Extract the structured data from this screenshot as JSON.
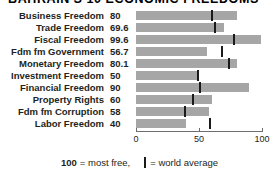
{
  "title": {
    "text": "BAHRAIN'S 10 ECONOMIC FREEDOMS",
    "clipped": true
  },
  "axis": {
    "ticks": [
      "0",
      "50",
      "100"
    ],
    "tick_values": [
      0,
      50,
      100
    ],
    "min": 0,
    "max": 100
  },
  "legend": {
    "scale_number": "100",
    "scale_text": "= most free,",
    "average_text": "= world average"
  },
  "colors": {
    "bar": "#a6a6a6",
    "tick": "#1a1a1a",
    "text": "#231f20",
    "axis": "#6d6e71",
    "background": "#ffffff"
  },
  "chart_data": {
    "type": "bar",
    "orientation": "horizontal",
    "title": "BAHRAIN'S 10 ECONOMIC FREEDOMS",
    "xlabel": "",
    "ylabel": "",
    "xlim": [
      0,
      100
    ],
    "xticks": [
      0,
      50,
      100
    ],
    "grid": false,
    "legend_position": "bottom",
    "categories": [
      "Business Freedom",
      "Trade Freedom",
      "Fiscal Freedom",
      "Fdm fm Government",
      "Monetary Freedom",
      "Investment Freedom",
      "Financial Freedom",
      "Property Rights",
      "Fdm fm Corruption",
      "Labor Freedom"
    ],
    "series": [
      {
        "name": "Country score",
        "values": [
          80,
          69.6,
          99.6,
          56.7,
          80.1,
          50,
          90,
          60,
          58,
          40
        ],
        "labels": [
          "80",
          "69.6",
          "99.6",
          "56.7",
          "80.1",
          "50",
          "90",
          "60",
          "58",
          "40"
        ]
      },
      {
        "name": "World average",
        "marker": "vertical-line",
        "values": [
          60,
          63,
          78,
          68,
          74,
          49,
          51,
          45,
          39,
          59
        ]
      }
    ]
  },
  "rows": [
    {
      "label": "Business Freedom",
      "value": "80",
      "score": 80,
      "world_average": 60
    },
    {
      "label": "Trade Freedom",
      "value": "69.6",
      "score": 69.6,
      "world_average": 63
    },
    {
      "label": "Fiscal Freedom",
      "value": "99.6",
      "score": 99.6,
      "world_average": 78
    },
    {
      "label": "Fdm fm Government",
      "value": "56.7",
      "score": 56.7,
      "world_average": 68
    },
    {
      "label": "Monetary Freedom",
      "value": "80.1",
      "score": 80.1,
      "world_average": 74
    },
    {
      "label": "Investment Freedom",
      "value": "50",
      "score": 50,
      "world_average": 49
    },
    {
      "label": "Financial Freedom",
      "value": "90",
      "score": 90,
      "world_average": 51
    },
    {
      "label": "Property Rights",
      "value": "60",
      "score": 60,
      "world_average": 45
    },
    {
      "label": "Fdm fm Corruption",
      "value": "58",
      "score": 58,
      "world_average": 39
    },
    {
      "label": "Labor Freedom",
      "value": "40",
      "score": 40,
      "world_average": 59
    }
  ]
}
